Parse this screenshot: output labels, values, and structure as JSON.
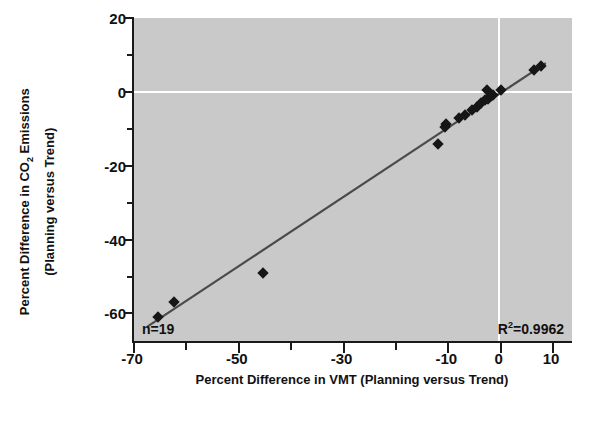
{
  "chart_data": {
    "type": "scatter",
    "title": "",
    "xlabel": "Percent Difference in VMT (Planning versus Trend)",
    "ylabel_line1": "Percent Difference in CO2 Emissions",
    "ylabel_line2": "(Planning versus Trend)",
    "ylabel_main_prefix": "Percent Difference in CO",
    "ylabel_main_sub": "2",
    "ylabel_main_suffix": " Emissions",
    "xlim": [
      -70,
      14
    ],
    "ylim": [
      -68,
      20
    ],
    "xticks": [
      -70,
      -50,
      -30,
      -10,
      0,
      10
    ],
    "xticklabels": [
      "-70",
      "-50",
      "-30",
      "-10",
      "0",
      "10"
    ],
    "xminorticks": [
      -60,
      -40,
      -20
    ],
    "yticks": [
      20,
      0,
      -20,
      -40,
      -60
    ],
    "yticklabels": [
      "20",
      "0",
      "-20",
      "-40",
      "-60"
    ],
    "yminorticks": [
      10,
      -10,
      -30,
      -50
    ],
    "grid": "white gridlines at x=0 and y=0",
    "gridlines": {
      "vertical_at_x": 0,
      "horizontal_at_y": 0
    },
    "legend": "none",
    "plot_background": "#c9c9c9",
    "marker": "filled black diamond",
    "series": [
      {
        "name": "Scenarios",
        "points": [
          [
            -65.0,
            -61.0
          ],
          [
            -62.0,
            -57.0
          ],
          [
            -45.0,
            -49.0
          ],
          [
            -11.5,
            -14.0
          ],
          [
            -10.3,
            -9.5
          ],
          [
            -10.0,
            -8.8
          ],
          [
            -7.5,
            -7.0
          ],
          [
            -6.4,
            -6.2
          ],
          [
            -5.0,
            -5.0
          ],
          [
            -4.2,
            -4.2
          ],
          [
            -3.3,
            -3.0
          ],
          [
            -2.6,
            -2.3
          ],
          [
            -2.0,
            -1.8
          ],
          [
            -1.4,
            -1.2
          ],
          [
            -1.0,
            -0.8
          ],
          [
            -2.2,
            0.4
          ],
          [
            0.4,
            0.6
          ],
          [
            6.8,
            5.8
          ],
          [
            8.0,
            6.9
          ]
        ]
      }
    ],
    "trendline": {
      "description": "linear fit through data",
      "x_start": -67.0,
      "y_start": -63.5,
      "x_end": 9.0,
      "y_end": 7.8,
      "color": "#4a4a4a"
    },
    "annotations": [
      {
        "name": "sample-size",
        "text": "n=19",
        "position": "bottom-left"
      },
      {
        "name": "r-squared",
        "text_prefix": "R",
        "text_sup": "2",
        "text_suffix": "=0.9962",
        "text": "R2=0.9962",
        "position": "bottom-right"
      }
    ]
  }
}
